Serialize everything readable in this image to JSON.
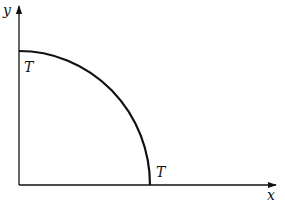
{
  "figure": {
    "type": "quarter-curve diagram",
    "axes": {
      "x_label": "x",
      "y_label": "y"
    },
    "curve": {
      "description": "convex curve from the y-axis intercept down to the x-axis intercept (quarter-ellipse-like)",
      "start_label": "T",
      "end_label": "T"
    },
    "colors": {
      "stroke": "#111111",
      "background": "#ffffff"
    }
  }
}
